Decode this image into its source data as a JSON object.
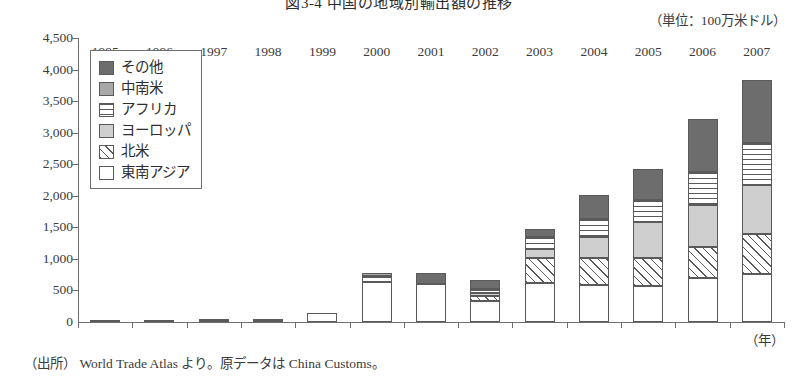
{
  "header": {
    "title": "図3-4 中国の地域別輸出額の推移",
    "unit_note": "（単位：100万米ドル）"
  },
  "footer": {
    "source": "（出所） World Trade Atlas より。原データは China Customs。"
  },
  "legend": {
    "items": [
      {
        "label": "その他",
        "key": "other",
        "pattern": "solid-dark-gray",
        "color": "#6d6d6d"
      },
      {
        "label": "中南米",
        "key": "latam",
        "pattern": "solid-mid-gray",
        "color": "#a8a8a8"
      },
      {
        "label": "アフリカ",
        "key": "africa",
        "pattern": "horizontal-lines",
        "color": "#ffffff"
      },
      {
        "label": "ヨーロッパ",
        "key": "europe",
        "pattern": "solid-light-gray",
        "color": "#cfcfcf"
      },
      {
        "label": "北米",
        "key": "namerica",
        "pattern": "diagonal-hatch",
        "color": "#ffffff"
      },
      {
        "label": "東南アジア",
        "key": "seasia",
        "pattern": "white-empty",
        "color": "#ffffff"
      }
    ]
  },
  "axes": {
    "x_unit_label": "（年）",
    "y_ticks": [
      "4,500",
      "4,000",
      "3,500",
      "3,000",
      "2,500",
      "2,000",
      "1,500",
      "1,000",
      "500",
      "0"
    ],
    "x_ticks": [
      "1995",
      "1996",
      "1997",
      "1998",
      "1999",
      "2000",
      "2001",
      "2002",
      "2003",
      "2004",
      "2005",
      "2006",
      "2007"
    ]
  },
  "chart_data": {
    "type": "bar",
    "subtype": "stacked",
    "title": "図3-4 中国の地域別輸出額の推移",
    "subtitle": "（単位：100万米ドル）",
    "xlabel": "（年）",
    "ylabel": "",
    "unit": "100万米ドル",
    "ylim": [
      0,
      4500
    ],
    "ytick_step": 500,
    "grid": false,
    "legend_position": "upper-left-inside",
    "categories": [
      "1995",
      "1996",
      "1997",
      "1998",
      "1999",
      "2000",
      "2001",
      "2002",
      "2003",
      "2004",
      "2005",
      "2006",
      "2007"
    ],
    "stack_order_bottom_to_top": [
      "東南アジア",
      "北米",
      "ヨーロッパ",
      "アフリカ",
      "中南米",
      "その他"
    ],
    "series": [
      {
        "name": "東南アジア",
        "key": "seasia",
        "values": [
          20,
          30,
          10,
          10,
          150,
          640,
          610,
          330,
          620,
          580,
          570,
          690,
          760
        ]
      },
      {
        "name": "北米",
        "key": "namerica",
        "values": [
          0,
          0,
          45,
          45,
          0,
          0,
          0,
          80,
          390,
          440,
          450,
          500,
          630
        ]
      },
      {
        "name": "ヨーロッパ",
        "key": "europe",
        "values": [
          0,
          0,
          0,
          0,
          0,
          0,
          0,
          50,
          140,
          320,
          560,
          660,
          780
        ]
      },
      {
        "name": "アフリカ",
        "key": "africa",
        "values": [
          0,
          0,
          0,
          0,
          0,
          95,
          0,
          70,
          200,
          290,
          350,
          530,
          660
        ]
      },
      {
        "name": "中南米",
        "key": "latam",
        "values": [
          0,
          0,
          0,
          0,
          0,
          40,
          0,
          0,
          0,
          0,
          0,
          0,
          0
        ]
      },
      {
        "name": "その他",
        "key": "other",
        "values": [
          0,
          0,
          0,
          0,
          0,
          0,
          160,
          130,
          130,
          380,
          500,
          840,
          1000
        ]
      }
    ],
    "totals": [
      20,
      30,
      55,
      55,
      150,
      775,
      770,
      660,
      1480,
      2010,
      2430,
      3220,
      3830
    ]
  }
}
